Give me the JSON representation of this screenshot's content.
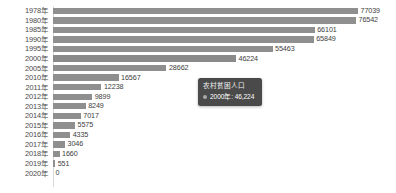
{
  "chart_data": {
    "type": "bar",
    "orientation": "horizontal",
    "title": "",
    "xlabel": "",
    "ylabel": "",
    "grid": false,
    "xlim": [
      0,
      77039
    ],
    "series_name": "农村贫困人口",
    "categories": [
      "1978年",
      "1980年",
      "1985年",
      "1990年",
      "1995年",
      "2000年",
      "2005年",
      "2010年",
      "2011年",
      "2012年",
      "2013年",
      "2014年",
      "2015年",
      "2016年",
      "2017年",
      "2018年",
      "2019年",
      "2020年"
    ],
    "values": [
      77039,
      76542,
      66101,
      65849,
      55463,
      46224,
      28662,
      16567,
      12238,
      9899,
      8249,
      7017,
      5575,
      4335,
      3046,
      1660,
      551,
      0
    ],
    "value_labels": [
      "77039",
      "76542",
      "66101",
      "65849",
      "55463",
      "46224",
      "28662",
      "16567",
      "12238",
      "9899",
      "8249",
      "7017",
      "5575",
      "4335",
      "3046",
      "1660",
      "551",
      "0"
    ],
    "highlighted_index": 5,
    "bar_color": "#8f8f8f",
    "bar_color_active": "#8a8a8a"
  },
  "tooltip": {
    "visible": true,
    "title": "农村贫困人口",
    "marker_color": "#a8a8a8",
    "value_text": "2000年: 46,224",
    "background": "#4a4a4a"
  }
}
